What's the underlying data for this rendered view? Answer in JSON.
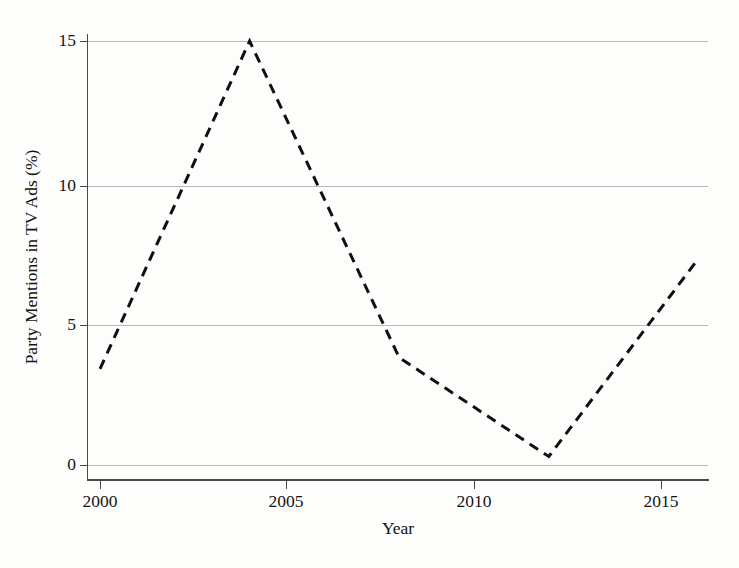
{
  "chart_data": {
    "type": "line",
    "title": "",
    "xlabel": "Year",
    "ylabel": "Party Mentions in TV Ads (%)",
    "x": [
      2000,
      2004,
      2008,
      2012,
      2016
    ],
    "values": [
      3.4,
      15.0,
      3.8,
      0.3,
      7.3
    ],
    "series": [
      {
        "name": "Party Mentions in TV Ads (%)",
        "x": [
          2000,
          2004,
          2008,
          2012,
          2016
        ],
        "values": [
          3.4,
          15.0,
          3.8,
          0.3,
          7.3
        ],
        "linestyle": "dashed",
        "color": "#101010",
        "linewidth": 3
      }
    ],
    "xlim": [
      1999.7,
      2016.3
    ],
    "ylim": [
      -0.55,
      15.95
    ],
    "xticks": [
      2000,
      2005,
      2010,
      2015
    ],
    "xtick_labels": [
      "2000",
      "2005",
      "2010",
      "2015"
    ],
    "yticks": [
      0,
      5,
      10,
      15
    ],
    "ytick_labels": [
      "0",
      "5",
      "10",
      "15"
    ],
    "grid": "horizontal",
    "grid_color": "#b9b9b9",
    "legend": "none",
    "spines": [
      "left",
      "bottom"
    ],
    "background": "#fdfdfc"
  },
  "axes": {
    "y_title": "Party Mentions in TV Ads (%)",
    "x_title": "Year"
  },
  "ticks": {
    "y": [
      {
        "label": "15",
        "value": 15
      },
      {
        "label": "10",
        "value": 10
      },
      {
        "label": "5",
        "value": 5
      },
      {
        "label": "0",
        "value": 0
      }
    ],
    "x": [
      {
        "label": "2000",
        "value": 2000
      },
      {
        "label": "2005",
        "value": 2005
      },
      {
        "label": "2010",
        "value": 2010
      },
      {
        "label": "2015",
        "value": 2015
      }
    ]
  }
}
